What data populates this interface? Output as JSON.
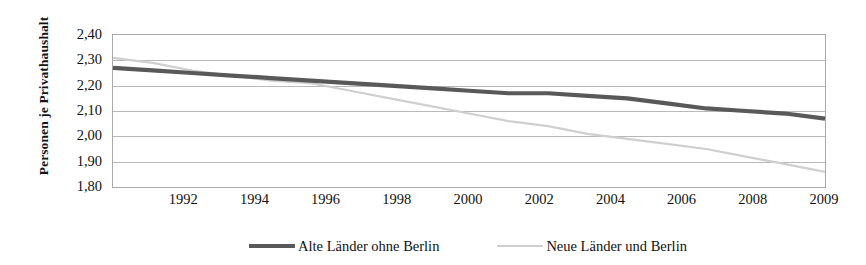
{
  "chart_data": {
    "type": "line",
    "title": "",
    "xlabel": "",
    "ylabel": "Personen je Privathaushalt",
    "ylim": [
      1.8,
      2.4
    ],
    "ytick_labels": [
      "2,40",
      "2,30",
      "2,20",
      "2,10",
      "2,00",
      "1,90",
      "1,80"
    ],
    "ytick_values": [
      2.4,
      2.3,
      2.2,
      2.1,
      2.0,
      1.9,
      1.8
    ],
    "xtick_labels": [
      "1992",
      "1994",
      "1996",
      "1998",
      "2000",
      "2002",
      "2004",
      "2006",
      "2008",
      "2009"
    ],
    "x": [
      1991,
      1992,
      1993,
      1994,
      1995,
      1996,
      1997,
      1998,
      1999,
      2000,
      2001,
      2002,
      2003,
      2004,
      2005,
      2006,
      2007,
      2008,
      2009
    ],
    "grid": true,
    "legend_position": "bottom",
    "series": [
      {
        "name": "Alte Länder ohne Berlin",
        "color": "#595959",
        "values": [
          2.27,
          2.26,
          2.25,
          2.24,
          2.23,
          2.22,
          2.21,
          2.2,
          2.19,
          2.18,
          2.17,
          2.17,
          2.16,
          2.15,
          2.13,
          2.11,
          2.1,
          2.09,
          2.07
        ]
      },
      {
        "name": "Neue Länder und Berlin",
        "color": "#cfcfcf",
        "values": [
          2.31,
          2.29,
          2.26,
          2.24,
          2.22,
          2.21,
          2.18,
          2.15,
          2.12,
          2.09,
          2.06,
          2.04,
          2.01,
          1.99,
          1.97,
          1.95,
          1.92,
          1.89,
          1.86
        ]
      }
    ]
  },
  "axis": {
    "y_title": "Personen je Privathaushalt"
  },
  "legend": {
    "items": [
      {
        "label": "Alte Länder ohne Berlin",
        "color": "#595959"
      },
      {
        "label": "Neue Länder und Berlin",
        "color": "#cfcfcf"
      }
    ]
  }
}
